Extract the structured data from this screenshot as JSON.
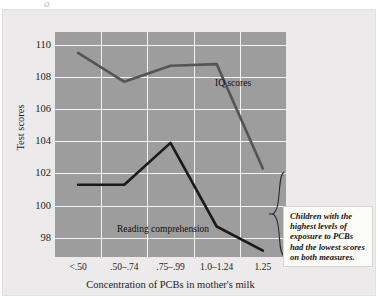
{
  "figure": {
    "crop_fragment": "g",
    "ylabel": "Test scores",
    "xlabel": "Concentration of PCBs in mother's milk",
    "annotation": "Children with the highest levels of exposure to PCBs had the lowest scores on both measures.",
    "colors": {
      "plot_background": "#9d9d9d",
      "panel_background": "#eceaea",
      "gridline": "#f2f2f2",
      "iq_line": "#555555",
      "reading_line": "#1a1a1a",
      "annotation_background": "#fbfbf8",
      "text": "#1d1d1d"
    }
  },
  "chart_data": {
    "type": "line",
    "title": "",
    "xlabel": "Concentration of PCBs in mother's milk",
    "ylabel": "Test scores",
    "categories": [
      "<.50",
      ".50–.74",
      ".75–.99",
      "1.0–1.24",
      "1.25"
    ],
    "yticks": [
      98,
      100,
      102,
      104,
      106,
      108,
      110
    ],
    "ylim": [
      96.8,
      110.8
    ],
    "grid": true,
    "legend": "inline-labels",
    "series": [
      {
        "name": "IQ scores",
        "color": "#555555",
        "values": [
          109.5,
          107.7,
          108.7,
          108.8,
          102.3
        ]
      },
      {
        "name": "Reading comprehension",
        "color": "#1a1a1a",
        "values": [
          101.3,
          101.3,
          103.9,
          98.7,
          97.2
        ]
      }
    ],
    "annotations": [
      {
        "text": "Children with the highest levels of exposure to PCBs had the lowest scores on both measures.",
        "target": "1.25",
        "style": "brace-callout"
      }
    ]
  }
}
